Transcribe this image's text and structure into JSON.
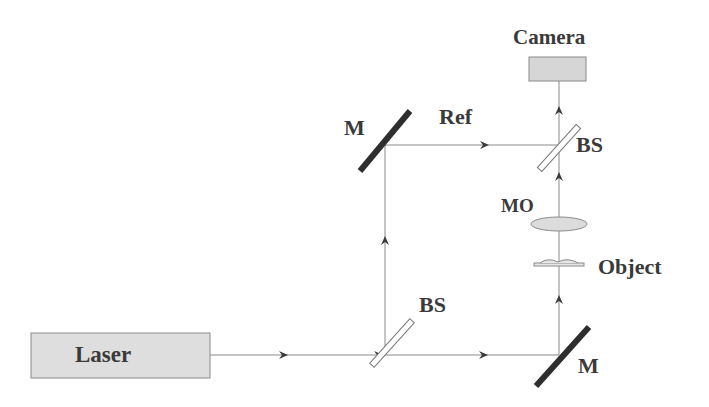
{
  "diagram": {
    "type": "optical-setup",
    "components": {
      "laser": {
        "label": "Laser"
      },
      "camera": {
        "label": "Camera"
      },
      "mirror_top": {
        "label": "M"
      },
      "mirror_bottom": {
        "label": "M"
      },
      "beamsplitter_bottom": {
        "label": "BS"
      },
      "beamsplitter_top": {
        "label": "BS"
      },
      "microscope_objective": {
        "label": "MO"
      },
      "object": {
        "label": "Object"
      },
      "reference_beam": {
        "label": "Ref"
      }
    },
    "colors": {
      "beam": "#8a8a8a",
      "arrow": "#3a3a3a",
      "mirror": "#2e2e2e",
      "box_fill": "#dcdcdc",
      "box_stroke": "#8a8a8a",
      "text": "#3a3a3a"
    }
  }
}
